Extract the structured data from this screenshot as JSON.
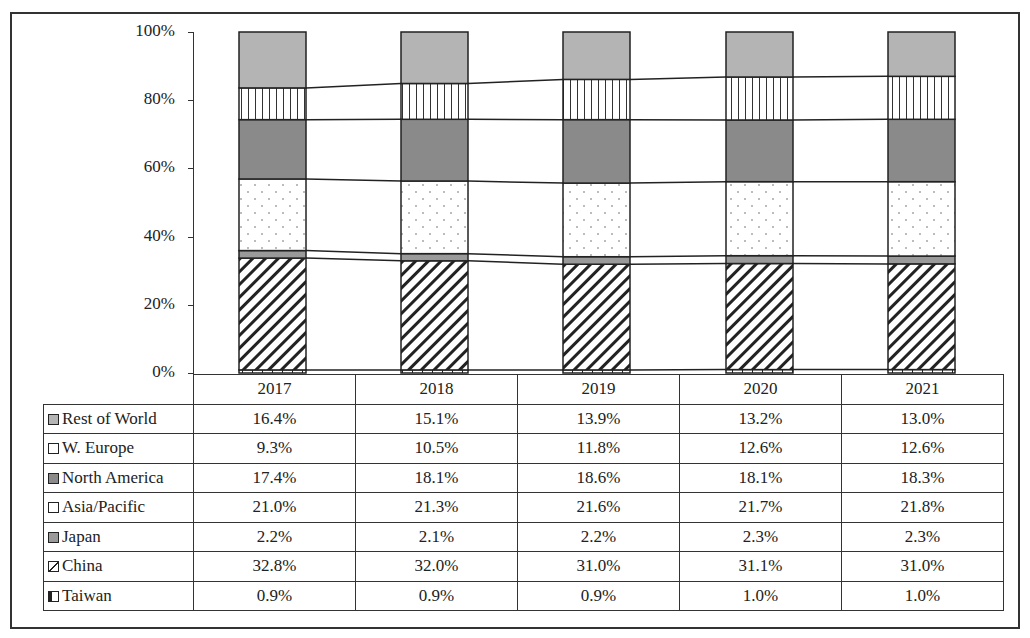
{
  "chart_data": {
    "type": "bar",
    "stacked": true,
    "normalized": true,
    "title": "",
    "xlabel": "",
    "ylabel": "",
    "ylim": [
      0,
      100
    ],
    "yticks": [
      "0%",
      "20%",
      "40%",
      "60%",
      "80%",
      "100%"
    ],
    "categories": [
      "2017",
      "2018",
      "2019",
      "2020",
      "2021"
    ],
    "legend_position": "data-table",
    "grid": false,
    "series": [
      {
        "name": "Taiwan",
        "pattern": "horizontal-small",
        "values": [
          0.9,
          0.9,
          0.9,
          1.0,
          1.0
        ],
        "labels": [
          "0.9%",
          "0.9%",
          "0.9%",
          "1.0%",
          "1.0%"
        ]
      },
      {
        "name": "China",
        "pattern": "diagonal-hatch",
        "values": [
          32.8,
          32.0,
          31.0,
          31.1,
          31.0
        ],
        "labels": [
          "32.8%",
          "32.0%",
          "31.0%",
          "31.1%",
          "31.0%"
        ]
      },
      {
        "name": "Japan",
        "pattern": "gray",
        "values": [
          2.2,
          2.1,
          2.2,
          2.3,
          2.3
        ],
        "labels": [
          "2.2%",
          "2.1%",
          "2.2%",
          "2.3%",
          "2.3%"
        ]
      },
      {
        "name": "Asia/Pacific",
        "pattern": "dots",
        "values": [
          21.0,
          21.3,
          21.6,
          21.7,
          21.8
        ],
        "labels": [
          "21.0%",
          "21.3%",
          "21.6%",
          "21.7%",
          "21.8%"
        ]
      },
      {
        "name": "North America",
        "pattern": "dark-gray",
        "values": [
          17.4,
          18.1,
          18.6,
          18.1,
          18.3
        ],
        "labels": [
          "17.4%",
          "18.1%",
          "18.6%",
          "18.1%",
          "18.3%"
        ]
      },
      {
        "name": "W. Europe",
        "pattern": "vertical-lines",
        "values": [
          9.3,
          10.5,
          11.8,
          12.6,
          12.6
        ],
        "labels": [
          "9.3%",
          "10.5%",
          "11.8%",
          "12.6%",
          "12.6%"
        ]
      },
      {
        "name": "Rest of World",
        "pattern": "light-gray",
        "values": [
          16.4,
          15.1,
          13.9,
          13.2,
          13.0
        ],
        "labels": [
          "16.4%",
          "15.1%",
          "13.9%",
          "13.2%",
          "13.0%"
        ]
      }
    ],
    "table_row_order": [
      "Rest of World",
      "W. Europe",
      "North America",
      "Asia/Pacific",
      "Japan",
      "China",
      "Taiwan"
    ]
  },
  "colors": {
    "light_gray": "#b4b4b4",
    "gray": "#9a9a9a",
    "dark_gray": "#8a8a8a",
    "line": "#222222"
  }
}
